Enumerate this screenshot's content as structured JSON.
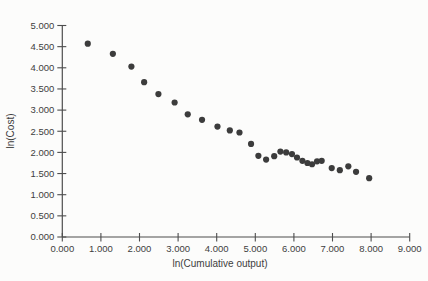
{
  "chart_data": {
    "type": "scatter",
    "title": "",
    "xlabel": "ln(Cumulative output)",
    "ylabel": "ln(Cost)",
    "xlim": [
      0,
      9
    ],
    "ylim": [
      0,
      5
    ],
    "grid": false,
    "legend": null,
    "x_tick_values": [
      0,
      1,
      2,
      3,
      4,
      5,
      6,
      7,
      8,
      9
    ],
    "x_tick_labels": [
      "0.000",
      "1.000",
      "2.000",
      "3.000",
      "4.000",
      "5.000",
      "6.000",
      "7.000",
      "8.000",
      "9.000"
    ],
    "y_tick_values": [
      0,
      0.5,
      1,
      1.5,
      2,
      2.5,
      3,
      3.5,
      4,
      4.5,
      5
    ],
    "y_tick_labels": [
      "0.000",
      "0.500",
      "1.000",
      "1.500",
      "2.000",
      "2.500",
      "3.000",
      "3.500",
      "4.000",
      "4.500",
      "5.000"
    ],
    "marker": {
      "shape": "circle",
      "radius": 3.1
    },
    "points": [
      [
        0.66,
        4.57
      ],
      [
        1.31,
        4.33
      ],
      [
        1.79,
        4.03
      ],
      [
        2.12,
        3.66
      ],
      [
        2.49,
        3.38
      ],
      [
        2.91,
        3.18
      ],
      [
        3.25,
        2.9
      ],
      [
        3.62,
        2.77
      ],
      [
        4.02,
        2.61
      ],
      [
        4.34,
        2.52
      ],
      [
        4.59,
        2.47
      ],
      [
        4.89,
        2.2
      ],
      [
        5.08,
        1.92
      ],
      [
        5.28,
        1.83
      ],
      [
        5.49,
        1.91
      ],
      [
        5.65,
        2.02
      ],
      [
        5.8,
        2.0
      ],
      [
        5.95,
        1.96
      ],
      [
        6.08,
        1.88
      ],
      [
        6.22,
        1.8
      ],
      [
        6.35,
        1.75
      ],
      [
        6.47,
        1.72
      ],
      [
        6.6,
        1.79
      ],
      [
        6.72,
        1.8
      ],
      [
        6.98,
        1.63
      ],
      [
        7.19,
        1.58
      ],
      [
        7.41,
        1.67
      ],
      [
        7.61,
        1.54
      ],
      [
        7.95,
        1.39
      ]
    ]
  },
  "colors": {
    "background": "#fcfcfb",
    "axis": "#4d4d4d",
    "text": "#3e3e3e",
    "marker": "#3c3c3c"
  }
}
